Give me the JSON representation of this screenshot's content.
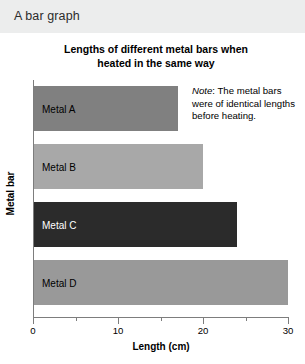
{
  "header": {
    "title": "A bar graph"
  },
  "note": {
    "label": "Note",
    "separator": ": ",
    "text": "The metal bars were of identical lengths before heating."
  },
  "chart_data": {
    "type": "bar",
    "orientation": "horizontal",
    "title_line1": "Lengths of different metal bars when",
    "title_line2": "heated in the same way",
    "title": "Lengths of different metal bars when heated in the same way",
    "xlabel": "Length (cm)",
    "ylabel": "Metal bar",
    "categories": [
      "Metal A",
      "Metal B",
      "Metal C",
      "Metal D"
    ],
    "values": [
      17,
      20,
      24,
      30
    ],
    "bar_colors": [
      "#808080",
      "#a8a8a8",
      "#2b2b2b",
      "#999999"
    ],
    "label_colors": [
      "#000000",
      "#000000",
      "#ffffff",
      "#000000"
    ],
    "xlim": [
      0,
      30
    ],
    "xticks": [
      0,
      10,
      20,
      30
    ],
    "xtick_labels": [
      "0",
      "10",
      "20",
      "30"
    ],
    "xticks_minor": [
      5,
      15,
      25
    ],
    "grid": false,
    "legend": false
  }
}
